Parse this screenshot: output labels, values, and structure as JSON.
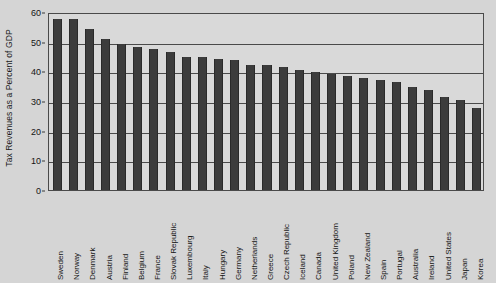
{
  "chart_data": {
    "type": "bar",
    "title": "",
    "xlabel": "",
    "ylabel": "Tax Revenues as a Percent of GDP",
    "ylim": [
      0,
      60
    ],
    "yticks": [
      0,
      10,
      20,
      30,
      40,
      50,
      60
    ],
    "grid": true,
    "legend": "none",
    "bar_color": "#3c3c3c",
    "background_color": "#d5d5d5",
    "plot_background_color": "#d9d9d9",
    "axis_color": "#4a4a4a",
    "categories": [
      "Sweden",
      "Norway",
      "Denmark",
      "Austria",
      "Finland",
      "Belgium",
      "France",
      "Slovak Republic",
      "Luxembourg",
      "Italy",
      "Hungary",
      "Germany",
      "Netherlands",
      "Greece",
      "Czech Republic",
      "Iceland",
      "Canada",
      "United Kingdom",
      "Poland",
      "New Zealand",
      "Spain",
      "Portugal",
      "Australia",
      "Ireland",
      "United States",
      "Japan",
      "Korea"
    ],
    "values": [
      57.8,
      57.5,
      54.3,
      51.0,
      49.2,
      48.3,
      47.5,
      46.4,
      45.0,
      44.9,
      44.3,
      43.7,
      42.3,
      42.0,
      41.3,
      40.6,
      39.8,
      39.0,
      38.4,
      37.8,
      37.2,
      36.3,
      34.6,
      33.8,
      31.5,
      30.3,
      27.5
    ]
  }
}
